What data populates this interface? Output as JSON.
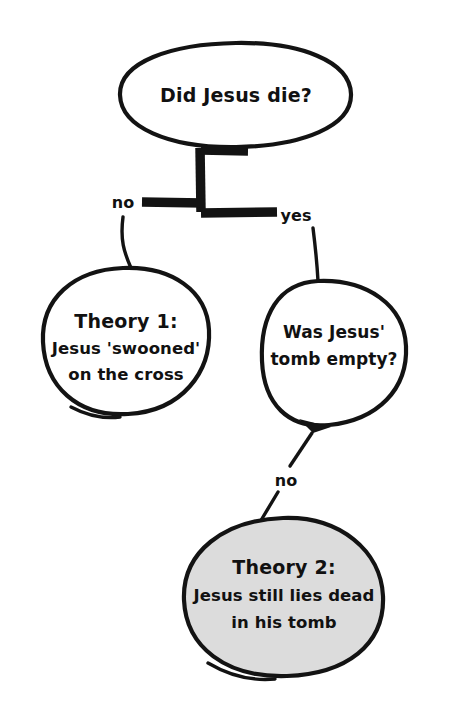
{
  "diagram": {
    "title": "Did Jesus die?",
    "background_color": "#ffffff",
    "ink_color": "#131313",
    "shaded_fill_color": "#dcdcdc",
    "style": "hand-drawn decision tree",
    "nodes": [
      {
        "id": "root",
        "shape": "ellipse",
        "fill": "white",
        "lines": [
          "Did Jesus die?"
        ]
      },
      {
        "id": "theory1",
        "shape": "ellipse",
        "fill": "white",
        "lines": [
          "Theory 1:",
          "Jesus 'swooned'",
          "on the cross"
        ]
      },
      {
        "id": "tomb",
        "shape": "ellipse",
        "fill": "white",
        "lines": [
          "Was Jesus'",
          "tomb empty?"
        ]
      },
      {
        "id": "theory2",
        "shape": "ellipse",
        "fill": "shaded",
        "lines": [
          "Theory 2:",
          "Jesus still lies dead",
          "in his tomb"
        ]
      }
    ],
    "edges": [
      {
        "id": "root-no",
        "from": "root",
        "to": "theory1",
        "label": "no"
      },
      {
        "id": "root-yes",
        "from": "root",
        "to": "tomb",
        "label": "yes"
      },
      {
        "id": "tomb-no",
        "from": "tomb",
        "to": "theory2",
        "label": "no"
      }
    ],
    "labels": {
      "root_no": "no",
      "root_yes": "yes",
      "tomb_no": "no"
    },
    "text": {
      "root_line1": "Did Jesus die?",
      "theory1_line1": "Theory 1:",
      "theory1_line2": "Jesus 'swooned'",
      "theory1_line3": "on the cross",
      "tomb_line1": "Was Jesus'",
      "tomb_line2": "tomb empty?",
      "theory2_line1": "Theory 2:",
      "theory2_line2": "Jesus still lies dead",
      "theory2_line3": "in his tomb"
    }
  }
}
